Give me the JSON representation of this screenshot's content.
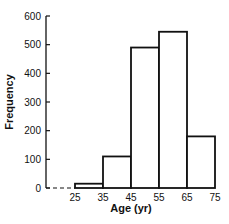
{
  "chart_data": {
    "type": "bar",
    "subtype": "histogram",
    "title": "",
    "xlabel": "Age (yr)",
    "ylabel": "Frequency",
    "bin_edges": [
      25,
      35,
      45,
      55,
      65,
      75
    ],
    "categories": [
      "25-35",
      "35-45",
      "45-55",
      "55-65",
      "65-75"
    ],
    "values": [
      15,
      110,
      490,
      545,
      180
    ],
    "x_ticks": [
      "25",
      "35",
      "45",
      "55",
      "65",
      "75"
    ],
    "y_ticks": [
      "0",
      "100",
      "200",
      "300",
      "400",
      "500",
      "600"
    ],
    "ylim": [
      0,
      600
    ],
    "xlim": [
      25,
      75
    ],
    "grid": false,
    "legend": null,
    "dashed_baseline_before_first_bin": true,
    "bar_fill": "#ffffff",
    "bar_stroke": "#111111"
  }
}
